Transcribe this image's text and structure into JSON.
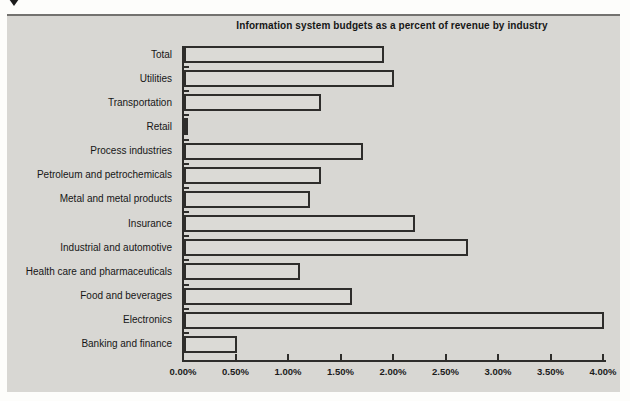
{
  "cursor": {
    "icon": "down-arrow-cursor"
  },
  "chart_data": {
    "type": "bar",
    "orientation": "horizontal",
    "title": "Information system budgets as a percent of revenue by industry",
    "categories": [
      "Total",
      "Utilities",
      "Transportation",
      "Retail",
      "Process industries",
      "Petroleum and petrochemicals",
      "Metal and metal products",
      "Insurance",
      "Industrial and automotive",
      "Health care and pharmaceuticals",
      "Food and beverages",
      "Electronics",
      "Banking and finance"
    ],
    "values": [
      1.9,
      2.0,
      1.3,
      0.04,
      1.7,
      1.3,
      1.2,
      2.2,
      2.7,
      1.1,
      1.6,
      4.0,
      0.5
    ],
    "unit": "%",
    "xlim": [
      0,
      4
    ],
    "x_ticks": [
      "0.00%",
      "0.50%",
      "1.00%",
      "1.50%",
      "2.00%",
      "2.50%",
      "3.00%",
      "3.50%",
      "4.00%"
    ],
    "xlabel": "",
    "ylabel": "",
    "grid": false,
    "legend": false,
    "colors": {
      "panel_bg": "#d8d7d3",
      "bar_fill": "#dbdad6",
      "line": "#2e2d2b",
      "text": "#161616"
    }
  }
}
